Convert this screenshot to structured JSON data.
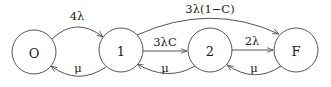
{
  "diagram": {
    "type": "state-transition (Markov chain)",
    "nodes": [
      {
        "id": "O",
        "label": "O",
        "cx": 34,
        "cy": 52,
        "r": 22
      },
      {
        "id": "1",
        "label": "1",
        "cx": 121,
        "cy": 50,
        "r": 22
      },
      {
        "id": "2",
        "label": "2",
        "cx": 210,
        "cy": 50,
        "r": 22
      },
      {
        "id": "F",
        "label": "F",
        "cx": 296,
        "cy": 50,
        "r": 22
      }
    ],
    "edges": [
      {
        "from": "O",
        "to": "1",
        "label": "4λ"
      },
      {
        "from": "1",
        "to": "O",
        "label": "μ"
      },
      {
        "from": "1",
        "to": "2",
        "label": "3λC"
      },
      {
        "from": "2",
        "to": "1",
        "label": "μ"
      },
      {
        "from": "2",
        "to": "F",
        "label": "2λ"
      },
      {
        "from": "F",
        "to": "2",
        "label": "μ"
      },
      {
        "from": "1",
        "to": "F",
        "label": "3λ(1−C)"
      }
    ]
  }
}
